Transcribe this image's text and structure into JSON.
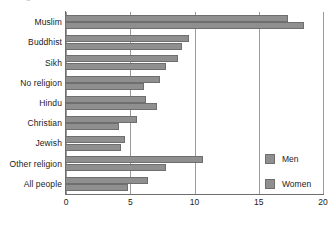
{
  "chart": {
    "title_remnant": "g",
    "legend_position": "inside-bottom-right"
  },
  "legend": {
    "items": [
      {
        "label": "Men",
        "color": "#8f8f8f",
        "swatch_name": "legend-swatch-men"
      },
      {
        "label": "Women",
        "color": "#8f8f8f",
        "swatch_name": "legend-swatch-women"
      }
    ]
  },
  "chart_data": {
    "type": "bar",
    "orientation": "horizontal",
    "title": "",
    "xlabel": "",
    "ylabel": "",
    "xlim": [
      0,
      20
    ],
    "xticks": [
      0,
      5,
      10,
      15,
      20
    ],
    "grid": true,
    "categories": [
      "Muslim",
      "Buddhist",
      "Sikh",
      "No religion",
      "Hindu",
      "Christian",
      "Jewish",
      "Other religion",
      "All people"
    ],
    "series": [
      {
        "name": "Men",
        "color": "#8f8f8f",
        "values": [
          17.3,
          9.6,
          8.7,
          7.3,
          6.2,
          5.5,
          4.6,
          10.7,
          6.4
        ]
      },
      {
        "name": "Women",
        "color": "#8f8f8f",
        "values": [
          18.5,
          9.0,
          7.8,
          6.1,
          7.1,
          4.1,
          4.3,
          7.8,
          4.8
        ]
      }
    ]
  }
}
